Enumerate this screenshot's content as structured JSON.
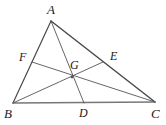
{
  "figure": {
    "background_color": "#ffffff",
    "stroke_color": "#555555",
    "side_color": "#4a4a4a",
    "base_color": "#777777",
    "label_color": "#1a1a1a",
    "width": 166,
    "height": 125
  },
  "labels": {
    "A": "A",
    "B": "B",
    "C": "C",
    "D": "D",
    "E": "E",
    "F": "F",
    "G": "G"
  },
  "points": {
    "A": {
      "x": 51,
      "y": 21,
      "label": "A",
      "label_x": 47,
      "label_y": 3
    },
    "B": {
      "x": 13,
      "y": 103,
      "label": "B",
      "label_x": 4,
      "label_y": 107
    },
    "C": {
      "x": 155,
      "y": 102,
      "label": "C",
      "label_x": 151,
      "label_y": 107
    },
    "D": {
      "x": 84,
      "y": 103,
      "label": "D",
      "label_x": 79,
      "label_y": 107
    },
    "E": {
      "x": 103,
      "y": 62,
      "label": "E",
      "label_x": 110,
      "label_y": 50
    },
    "F": {
      "x": 32,
      "y": 62,
      "label": "F",
      "label_x": 19,
      "label_y": 51
    },
    "G": {
      "x": 72,
      "y": 77,
      "label": "G",
      "label_x": 70,
      "label_y": 59
    }
  },
  "segments": [
    {
      "name": "side-AB",
      "from": "A",
      "to": "B",
      "width": 1.2,
      "color": "#4a4a4a"
    },
    {
      "name": "side-AC",
      "from": "A",
      "to": "C",
      "width": 1.5,
      "color": "#4a4a4a"
    },
    {
      "name": "side-BC",
      "from": "B",
      "to": "C",
      "width": 1.6,
      "color": "#777777"
    },
    {
      "name": "cevian-AD",
      "from": "A",
      "to": "D",
      "width": 0.9,
      "color": "#555555"
    },
    {
      "name": "cevian-BE",
      "from": "B",
      "to": "E",
      "width": 0.9,
      "color": "#555555"
    },
    {
      "name": "cevian-CF",
      "from": "F",
      "to": "C",
      "width": 0.9,
      "color": "#555555"
    }
  ]
}
